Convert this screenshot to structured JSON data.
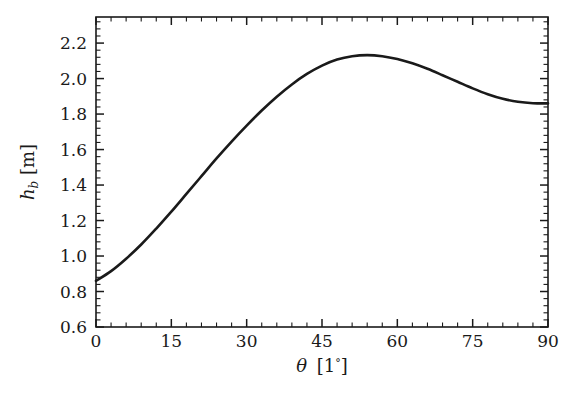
{
  "figure": {
    "background_color": "#ffffff",
    "frame_color": "#1a1a1a",
    "curve_color": "#1a1a1a",
    "curve_width_px": 2.6,
    "frame": {
      "left": 96,
      "right": 548,
      "top": 17,
      "bottom": 327
    }
  },
  "chart_data": {
    "type": "line",
    "title": "",
    "xlabel": "θ [1°]",
    "xlabel_parts": {
      "symbol": "θ",
      "open": "[1",
      "degree": "°",
      "close": "]"
    },
    "ylabel": "h_b [m]",
    "ylabel_parts": {
      "symbol": "h",
      "subscript": "b",
      "unit": "[m]"
    },
    "xlim": [
      0,
      90
    ],
    "ylim": [
      0.6,
      2.347
    ],
    "xticks": [
      0,
      15,
      30,
      45,
      60,
      75,
      90
    ],
    "xticklabels": [
      "0",
      "15",
      "30",
      "45",
      "60",
      "75",
      "90"
    ],
    "xminor_step": 3,
    "yticks": [
      0.6,
      0.8,
      1.0,
      1.2,
      1.4,
      1.6,
      1.8,
      2.0,
      2.2
    ],
    "yticklabels": [
      "0.6",
      "0.8",
      "1.0",
      "1.2",
      "1.4",
      "1.6",
      "1.8",
      "2.0",
      "2.2"
    ],
    "yminor_step": 0.04,
    "grid": false,
    "legend": null,
    "series": [
      {
        "name": "h_b",
        "x": [
          0,
          3,
          6,
          9,
          12,
          15,
          18,
          21,
          24,
          27,
          30,
          33,
          36,
          39,
          42,
          45,
          48,
          51,
          54,
          57,
          60,
          63,
          66,
          69,
          72,
          75,
          78,
          81,
          84,
          87,
          90
        ],
        "values": [
          0.86,
          0.915,
          0.985,
          1.065,
          1.155,
          1.25,
          1.35,
          1.45,
          1.55,
          1.645,
          1.735,
          1.82,
          1.898,
          1.967,
          2.026,
          2.073,
          2.107,
          2.126,
          2.132,
          2.126,
          2.11,
          2.086,
          2.055,
          2.019,
          1.982,
          1.945,
          1.912,
          1.886,
          1.869,
          1.861,
          1.86
        ]
      }
    ],
    "annotations": [
      {
        "label": "start",
        "x": 0,
        "y": 0.86
      },
      {
        "label": "peak",
        "x": 54,
        "y": 2.132
      },
      {
        "label": "end",
        "x": 90,
        "y": 1.86
      }
    ]
  }
}
